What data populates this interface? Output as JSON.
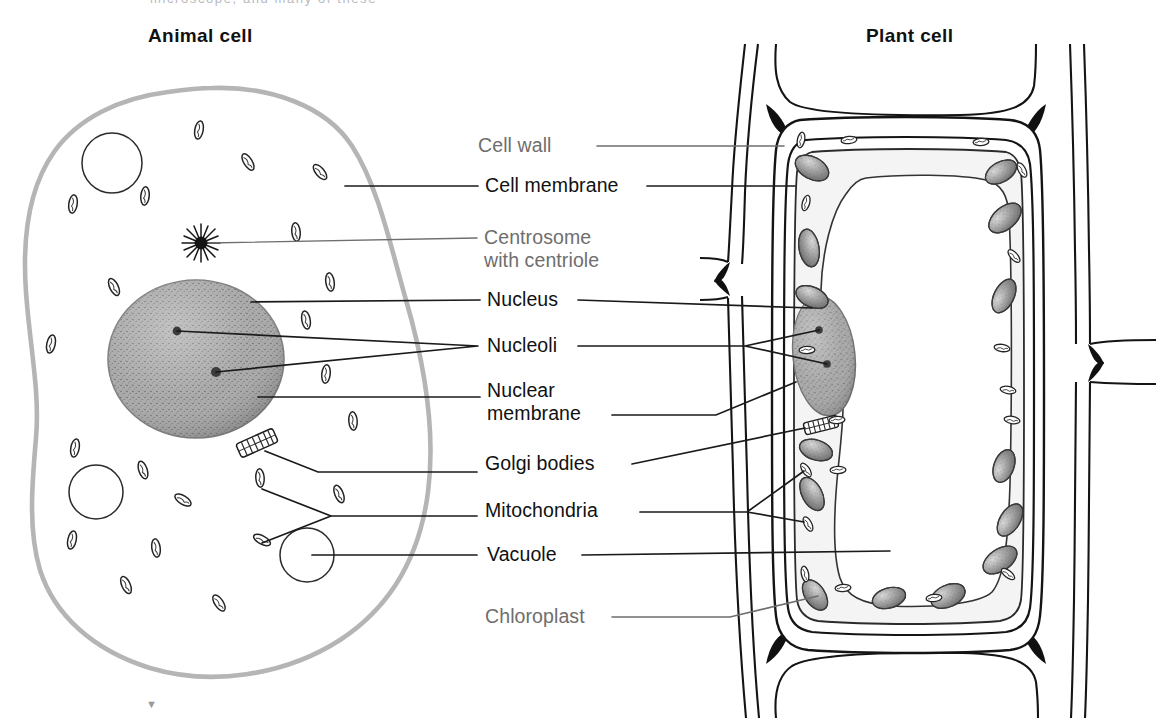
{
  "figure": {
    "type": "biology-diagram",
    "background_color": "#ffffff",
    "cut_off_top_text": "microscope, and many of these"
  },
  "headings": {
    "animal": "Animal cell",
    "plant": "Plant cell"
  },
  "colors": {
    "label_dark": "#111111",
    "label_gray": "#6e6e6e",
    "leader_line": "#1a1a1a",
    "animal_membrane": "#b5b5b5",
    "cell_wall_line": "#141414",
    "nucleus_fill": "#9b9b9b",
    "chloroplast_fill": "#8e8e8e",
    "organelle_outline": "#222222"
  },
  "labels": [
    {
      "id": "cell-wall",
      "text": "Cell wall",
      "line2": "",
      "tone": "gray",
      "x": 478,
      "y": 134,
      "points_to": [
        "plant"
      ]
    },
    {
      "id": "cell-membrane",
      "text": "Cell membrane",
      "line2": "",
      "tone": "dark",
      "x": 485,
      "y": 174,
      "points_to": [
        "animal",
        "plant"
      ]
    },
    {
      "id": "centrosome",
      "text": "Centrosome",
      "line2": "with centriole",
      "tone": "gray",
      "x": 484,
      "y": 226,
      "points_to": [
        "animal"
      ]
    },
    {
      "id": "nucleus",
      "text": "Nucleus",
      "line2": "",
      "tone": "dark",
      "x": 487,
      "y": 288,
      "points_to": [
        "animal",
        "plant"
      ]
    },
    {
      "id": "nucleoli",
      "text": "Nucleoli",
      "line2": "",
      "tone": "dark",
      "x": 487,
      "y": 334,
      "points_to": [
        "animal",
        "plant"
      ]
    },
    {
      "id": "nuclear-membrane",
      "text": "Nuclear",
      "line2": "membrane",
      "tone": "dark",
      "x": 487,
      "y": 379,
      "points_to": [
        "animal",
        "plant"
      ]
    },
    {
      "id": "golgi-bodies",
      "text": "Golgi bodies",
      "line2": "",
      "tone": "dark",
      "x": 485,
      "y": 452,
      "points_to": [
        "animal",
        "plant"
      ]
    },
    {
      "id": "mitochondria",
      "text": "Mitochondria",
      "line2": "",
      "tone": "dark",
      "x": 485,
      "y": 499,
      "points_to": [
        "animal",
        "plant"
      ]
    },
    {
      "id": "vacuole",
      "text": "Vacuole",
      "line2": "",
      "tone": "dark",
      "x": 487,
      "y": 543,
      "points_to": [
        "animal",
        "plant"
      ]
    },
    {
      "id": "chloroplast",
      "text": "Chloroplast",
      "line2": "",
      "tone": "gray",
      "x": 485,
      "y": 605,
      "points_to": [
        "plant"
      ]
    }
  ],
  "animal_cell": {
    "name": "Animal cell",
    "membrane_style": "single soft gray irregular outline",
    "structures": {
      "nucleus": "large stippled gray sphere",
      "nucleoli": 2,
      "centrosome": "dark starburst aster with centriole",
      "golgi_bodies": 1,
      "mitochondria_count": 22,
      "vacuoles_count": 3
    }
  },
  "plant_cell": {
    "name": "Plant cell",
    "wall_style": "thick double-line cell wall shared with neighbouring cells",
    "structures": {
      "central_vacuole": "large central vacuole filling most of the cell",
      "nucleus": "stippled gray oval pressed against left wall",
      "nucleoli": 2,
      "golgi_bodies": 1,
      "chloroplasts_count": 14,
      "mitochondria_count": 18
    }
  }
}
